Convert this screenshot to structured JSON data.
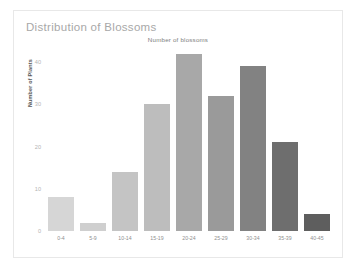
{
  "chart_data": {
    "type": "bar",
    "title": "Distribution of Blossoms",
    "subtitle": "Number of blossoms",
    "xlabel": "",
    "ylabel": "Number of Plants",
    "categories": [
      "0-4",
      "5-9",
      "10-14",
      "15-19",
      "20-24",
      "25-29",
      "30-34",
      "35-39",
      "40-45"
    ],
    "values": [
      8,
      2,
      14,
      30,
      42,
      32,
      39,
      21,
      4
    ],
    "bar_colors": [
      "#d6d6d6",
      "#cfcfcf",
      "#c4c4c4",
      "#bdbdbd",
      "#a8a8a8",
      "#9a9a9a",
      "#828282",
      "#6e6e6e",
      "#5e5e5e"
    ],
    "ylim": [
      0,
      45
    ],
    "yticks": [
      0,
      10,
      20,
      30,
      40
    ],
    "ytick_labels": [
      "0",
      "10",
      "20",
      "30",
      "40"
    ],
    "grid": false,
    "legend": "none"
  }
}
